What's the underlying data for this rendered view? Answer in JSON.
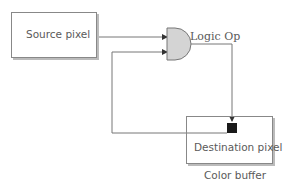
{
  "diagram": {
    "source_box": {
      "label": "Source pixel"
    },
    "logic_gate": {
      "label": "Logic Op"
    },
    "destination_box": {
      "label": "Destination pixel",
      "caption": "Color buffer"
    }
  },
  "colors": {
    "line": "#777777",
    "gate_fill": "#d4d4d4",
    "box_border": "#888888",
    "marker": "#1a1a1a"
  }
}
